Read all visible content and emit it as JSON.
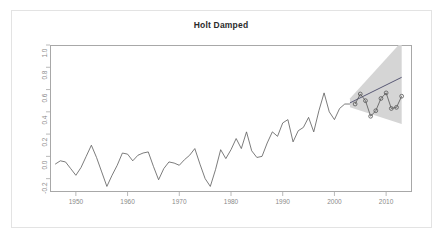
{
  "chart_data": {
    "type": "line",
    "title": "Holt Damped",
    "xlabel": "",
    "ylabel": "",
    "xlim": [
      1945,
      2015
    ],
    "ylim": [
      -0.32,
      1.0
    ],
    "grid": false,
    "legend": "none",
    "xticks": [
      "1950",
      "1960",
      "1970",
      "1980",
      "1990",
      "2000",
      "2010"
    ],
    "xtick_values": [
      1950,
      1960,
      1970,
      1980,
      1990,
      2000,
      2010
    ],
    "yticks": [
      "1.0",
      "0.8",
      "0.6",
      "0.4",
      "0.2",
      "0.0",
      "-0.2"
    ],
    "ytick_values": [
      1.0,
      0.8,
      0.6,
      0.4,
      0.2,
      0.0,
      -0.2
    ],
    "series": [
      {
        "name": "historical",
        "style": "line",
        "color": "#5a5a5a",
        "x": [
          1946,
          1947,
          1948,
          1949,
          1950,
          1951,
          1952,
          1953,
          1954,
          1955,
          1956,
          1957,
          1958,
          1959,
          1960,
          1961,
          1962,
          1963,
          1964,
          1965,
          1966,
          1967,
          1968,
          1969,
          1970,
          1971,
          1972,
          1973,
          1974,
          1975,
          1976,
          1977,
          1978,
          1979,
          1980,
          1981,
          1982,
          1983,
          1984,
          1985,
          1986,
          1987,
          1988,
          1989,
          1990,
          1991,
          1992,
          1993,
          1994,
          1995,
          1996,
          1997,
          1998,
          1999,
          2000,
          2001,
          2002,
          2003
        ],
        "values": [
          -0.07,
          -0.04,
          -0.05,
          -0.11,
          -0.17,
          -0.1,
          0.0,
          0.1,
          -0.01,
          -0.14,
          -0.27,
          -0.17,
          -0.08,
          0.03,
          0.02,
          -0.04,
          0.01,
          0.03,
          0.04,
          -0.09,
          -0.21,
          -0.11,
          -0.05,
          -0.06,
          -0.08,
          -0.03,
          0.01,
          0.07,
          -0.07,
          -0.2,
          -0.27,
          -0.12,
          0.06,
          -0.02,
          0.06,
          0.16,
          0.07,
          0.22,
          0.05,
          -0.01,
          0.0,
          0.12,
          0.22,
          0.18,
          0.3,
          0.33,
          0.13,
          0.23,
          0.26,
          0.35,
          0.22,
          0.41,
          0.57,
          0.4,
          0.33,
          0.43,
          0.47,
          0.47
        ]
      },
      {
        "name": "forecast-trend",
        "style": "line",
        "color": "#4a4a6a",
        "x": [
          2003,
          2013
        ],
        "values": [
          0.48,
          0.71
        ]
      },
      {
        "name": "observed-forecast-period",
        "style": "line-markers",
        "color": "#555555",
        "marker": "circle-open",
        "x": [
          2004,
          2005,
          2006,
          2007,
          2008,
          2009,
          2010,
          2011,
          2012,
          2013
        ],
        "values": [
          0.47,
          0.56,
          0.5,
          0.36,
          0.41,
          0.52,
          0.57,
          0.43,
          0.44,
          0.54
        ]
      }
    ],
    "prediction_interval": {
      "name": "prediction-interval-band",
      "color": "#d5d5d5",
      "x": [
        2003,
        2013
      ],
      "lower": [
        0.44,
        0.29
      ],
      "upper": [
        0.52,
        1.03
      ]
    }
  }
}
